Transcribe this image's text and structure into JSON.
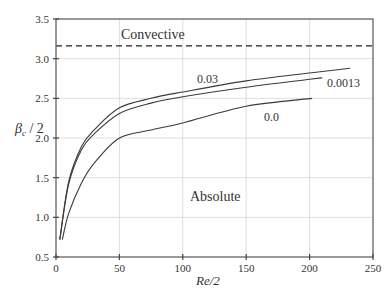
{
  "chart_data": {
    "type": "line",
    "title": "",
    "xlabel": "Re/2",
    "ylabel": "βc / 2",
    "ylabel_main": "β",
    "ylabel_sub": "c",
    "ylabel_rest": " / 2",
    "xlim": [
      0,
      250
    ],
    "ylim": [
      0.5,
      3.5
    ],
    "xticks": [
      0,
      50,
      100,
      150,
      200,
      250
    ],
    "yticks": [
      0.5,
      1.0,
      1.5,
      2.0,
      2.5,
      3.0,
      3.5
    ],
    "xtick_labels": [
      "0",
      "50",
      "100",
      "150",
      "200",
      "250"
    ],
    "ytick_labels": [
      "0.5",
      "1.0",
      "1.5",
      "2.0",
      "2.5",
      "3.0",
      "3.5"
    ],
    "grid": true,
    "legend": "none (inline curve labels)",
    "series": [
      {
        "name": "0.03",
        "x": [
          3,
          10,
          20,
          30,
          50,
          75,
          100,
          150,
          200,
          232
        ],
        "y": [
          0.72,
          1.45,
          1.89,
          2.1,
          2.38,
          2.5,
          2.58,
          2.72,
          2.82,
          2.88
        ]
      },
      {
        "name": "0.0013",
        "x": [
          3,
          10,
          20,
          30,
          50,
          75,
          100,
          150,
          200,
          210
        ],
        "y": [
          0.72,
          1.42,
          1.85,
          2.05,
          2.31,
          2.44,
          2.52,
          2.64,
          2.74,
          2.76
        ]
      },
      {
        "name": "0.0",
        "x": [
          5,
          10,
          20,
          30,
          50,
          75,
          100,
          150,
          202
        ],
        "y": [
          0.72,
          1.05,
          1.43,
          1.68,
          2.0,
          2.1,
          2.19,
          2.4,
          2.5
        ]
      }
    ],
    "reference_lines": [
      {
        "type": "horizontal",
        "y": 3.16,
        "style": "dashed",
        "label": "boundary"
      }
    ],
    "annotations": [
      {
        "text": "Convective",
        "x": 65,
        "y": 3.33
      },
      {
        "text": "Absolute",
        "x": 135,
        "y": 1.33
      },
      {
        "text": "0.03",
        "x": 110,
        "y": 2.67
      },
      {
        "text": "0.0013",
        "x": 217,
        "y": 2.73
      },
      {
        "text": "0.0",
        "x": 165,
        "y": 2.3
      }
    ]
  },
  "labels": {
    "convective": "Convective",
    "absolute": "Absolute",
    "curve_003": "0.03",
    "curve_00013": "0.0013",
    "curve_00": "0.0",
    "xlabel": "Re/2",
    "ylabel_main": "β",
    "ylabel_sub": "c",
    "ylabel_rest": " / 2"
  },
  "colors": {
    "axis": "#555555",
    "grid": "#d6d6d6",
    "curve": "#3a3a3a",
    "text": "#333333"
  }
}
